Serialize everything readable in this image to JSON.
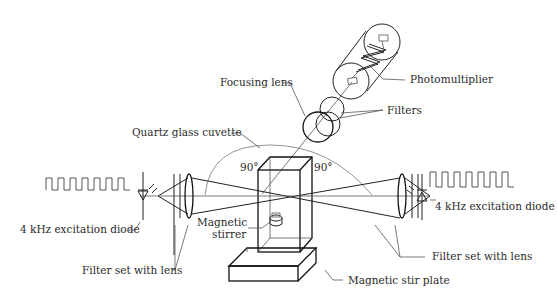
{
  "figure": {
    "colors": {
      "line": "#222222",
      "text": "#2a2a2a",
      "background": "#ffffff"
    }
  },
  "labels": {
    "photomultiplier": "Photomultiplier",
    "filters": "Filters",
    "focusing_lens": "Focusing lens",
    "cuvette": "Quartz glass cuvette",
    "angle_left": "90°",
    "angle_right": "90°",
    "diode_left": "4 kHz excitation diode",
    "diode_right": "4 kHz excitation diode",
    "stirrer_line1": "Magnetic",
    "stirrer_line2": "stirrer",
    "filter_set_left": "Filter set with lens",
    "filter_set_right": "Filter set with lens",
    "stir_plate": "Magnetic stir plate"
  },
  "components": [
    {
      "name": "photomultiplier",
      "icon": "photomultiplier-tube-icon"
    },
    {
      "name": "filters",
      "icon": "optical-filter-icon"
    },
    {
      "name": "focusing-lens",
      "icon": "lens-icon"
    },
    {
      "name": "quartz-glass-cuvette",
      "icon": "cuvette-icon"
    },
    {
      "name": "excitation-diode-left",
      "icon": "led-diode-icon"
    },
    {
      "name": "excitation-diode-right",
      "icon": "led-diode-icon"
    },
    {
      "name": "filter-set-left",
      "icon": "filter-lens-icon"
    },
    {
      "name": "filter-set-right",
      "icon": "filter-lens-icon"
    },
    {
      "name": "magnetic-stirrer",
      "icon": "stir-bar-icon"
    },
    {
      "name": "magnetic-stir-plate",
      "icon": "stir-plate-icon"
    }
  ]
}
